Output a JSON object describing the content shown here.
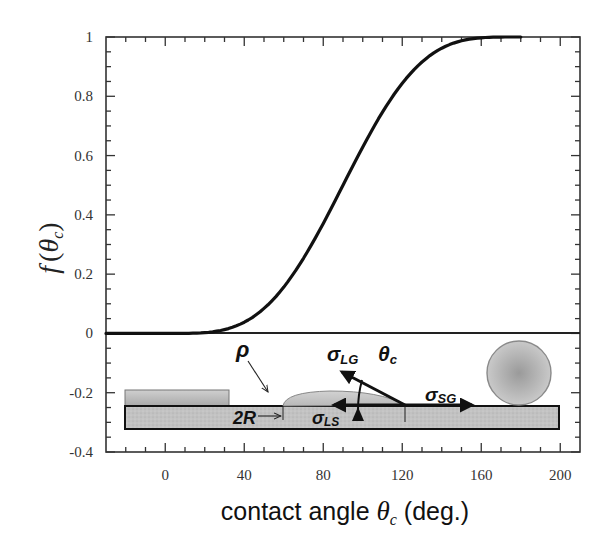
{
  "chart_data": {
    "type": "line",
    "title": "",
    "xlabel": "contact angle θc (deg.)",
    "xlabel_parts": {
      "prefix": "contact angle ",
      "symbol": "θ",
      "subscript": "c",
      "suffix": " (deg.)"
    },
    "ylabel": "f (θc)",
    "ylabel_parts": {
      "func": "f",
      "open": "(",
      "symbol": "θ",
      "subscript": "c",
      "close": ")"
    },
    "xlim": [
      -30,
      210
    ],
    "ylim": [
      -0.4,
      1.0
    ],
    "x_ticks": [
      0,
      40,
      80,
      120,
      160,
      200
    ],
    "x_tick_labels": [
      "0",
      "40",
      "80",
      "120",
      "160",
      "200"
    ],
    "y_ticks": [
      1,
      0.8,
      0.6,
      0.4,
      0.2,
      0,
      -0.2,
      -0.4
    ],
    "y_tick_labels": [
      "1",
      "0.8",
      "0.6",
      "0.4",
      "0.2",
      "0",
      "-0.2",
      "-0.4"
    ],
    "grid": false,
    "legend": null,
    "series": [
      {
        "name": "f(θc) = (2 + cos θc)(1 − cos θc)² / 4",
        "x": [
          -30,
          0,
          10,
          20,
          30,
          40,
          50,
          60,
          70,
          80,
          90,
          100,
          110,
          120,
          130,
          140,
          150,
          160,
          170,
          180,
          210
        ],
        "values": [
          0,
          0,
          0.0002,
          0.0027,
          0.0129,
          0.0379,
          0.0843,
          0.1563,
          0.2535,
          0.3711,
          0.5,
          0.6289,
          0.7465,
          0.8438,
          0.9157,
          0.9626,
          0.9871,
          0.9973,
          0.9998,
          1.0,
          1.0
        ],
        "color": "#111111"
      },
      {
        "name": "zero baseline",
        "x": [
          -30,
          210
        ],
        "values": [
          0,
          0
        ],
        "color": "#222222"
      }
    ],
    "annotations": {
      "inset_schematic": {
        "description": "Schematic of a droplet on a substrate showing surface tension balance and a sphere (θc = 180°)",
        "labels": [
          "ρ",
          "σLG",
          "θc",
          "σSG",
          "2R",
          "σLS"
        ],
        "label_parts": {
          "rho": "ρ",
          "sigma_lg": {
            "base": "σ",
            "sub": "LG"
          },
          "theta_c": {
            "base": "θ",
            "sub": "c"
          },
          "sigma_sg": {
            "base": "σ",
            "sub": "SG"
          },
          "two_r": "2R",
          "sigma_ls": {
            "base": "σ",
            "sub": "LS"
          }
        }
      }
    }
  },
  "colors": {
    "axis": "#333333",
    "curve": "#111111",
    "substrate_fill": "#bdbdbd",
    "substrate_top_fill": "#c8c8c8",
    "droplet_fill": "#c4c4c4",
    "sphere_fill": "#b0b0b0",
    "sphere_edge": "#8a8a8a"
  }
}
